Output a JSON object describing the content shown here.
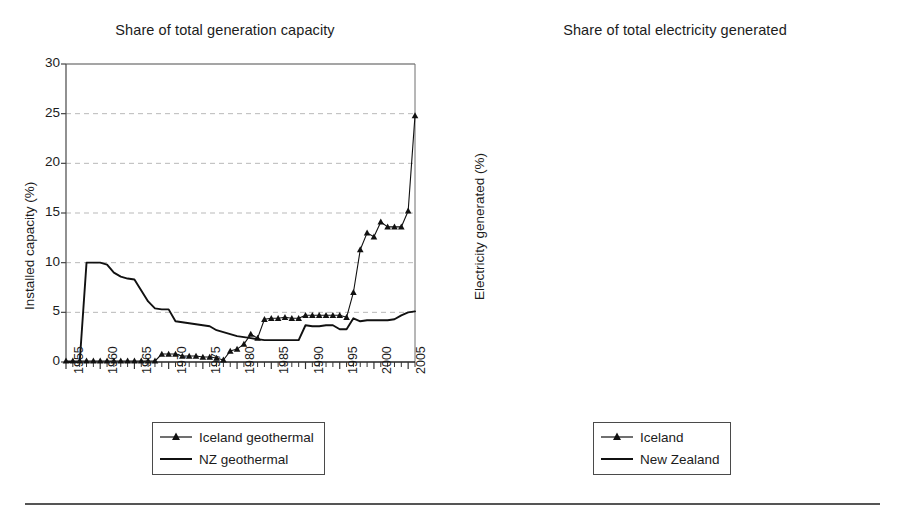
{
  "figure": {
    "background": "#ffffff",
    "rule_color": "#555555",
    "axis_color": "#6e6e6e",
    "grid_color": "#b9b9b9",
    "series_color": "#111111"
  },
  "chart_data": [
    {
      "type": "line",
      "panel": "left",
      "title": "Share of total generation capacity",
      "xlabel": "",
      "ylabel": "Installed capacity (%)",
      "ylim": [
        0,
        30
      ],
      "yticks": [
        0,
        5,
        10,
        15,
        20,
        25,
        30
      ],
      "xlim": [
        1955,
        2006
      ],
      "xticks": [
        1955,
        1960,
        1965,
        1970,
        1975,
        1980,
        1985,
        1990,
        1995,
        2000,
        2005
      ],
      "grid": "horizontal-dashed",
      "legend_position": "below-center",
      "x": [
        1955,
        1956,
        1957,
        1958,
        1959,
        1960,
        1961,
        1962,
        1963,
        1964,
        1965,
        1966,
        1967,
        1968,
        1969,
        1970,
        1971,
        1972,
        1973,
        1974,
        1975,
        1976,
        1977,
        1978,
        1979,
        1980,
        1981,
        1982,
        1983,
        1984,
        1985,
        1986,
        1987,
        1988,
        1989,
        1990,
        1991,
        1992,
        1993,
        1994,
        1995,
        1996,
        1997,
        1998,
        1999,
        2000,
        2001,
        2002,
        2003,
        2004,
        2005,
        2006
      ],
      "series": [
        {
          "name": "Iceland geothermal",
          "marker": "triangle",
          "values": [
            0.1,
            0.1,
            0.1,
            0.1,
            0.1,
            0.1,
            0.1,
            0.1,
            0.1,
            0.1,
            0.1,
            0.1,
            0.1,
            0.1,
            0.8,
            0.8,
            0.8,
            0.6,
            0.6,
            0.6,
            0.5,
            0.5,
            0.4,
            0.2,
            1.1,
            1.3,
            1.8,
            2.8,
            2.4,
            4.3,
            4.4,
            4.4,
            4.5,
            4.4,
            4.4,
            4.7,
            4.7,
            4.7,
            4.7,
            4.7,
            4.7,
            4.5,
            7.0,
            11.3,
            13.0,
            12.6,
            14.1,
            13.6,
            13.6,
            13.6,
            15.2,
            24.8
          ]
        },
        {
          "name": "NZ geothermal",
          "marker": "none",
          "values": [
            0.0,
            0.0,
            0.0,
            10.0,
            10.0,
            10.0,
            9.8,
            9.0,
            8.6,
            8.4,
            8.3,
            7.2,
            6.1,
            5.4,
            5.3,
            5.3,
            4.1,
            4.0,
            3.9,
            3.8,
            3.7,
            3.6,
            3.2,
            3.0,
            2.8,
            2.6,
            2.5,
            2.4,
            2.3,
            2.2,
            2.2,
            2.2,
            2.2,
            2.2,
            2.2,
            3.7,
            3.6,
            3.6,
            3.7,
            3.7,
            3.3,
            3.3,
            4.4,
            4.1,
            4.2,
            4.2,
            4.2,
            4.2,
            4.3,
            4.7,
            5.0,
            5.1
          ]
        }
      ]
    },
    {
      "type": "line",
      "panel": "right",
      "title": "Share of total electricity generated",
      "xlabel": "",
      "ylabel": "Electricity generated (%)",
      "ylim": [
        0,
        30
      ],
      "yticks": [
        0,
        5,
        10,
        15,
        20,
        25,
        30
      ],
      "xlim": [
        1955,
        2006
      ],
      "xticks": [
        1955,
        1960,
        1965,
        1970,
        1975,
        1980,
        1985,
        1990,
        1995,
        2000,
        2005
      ],
      "grid": "horizontal-dashed",
      "legend_position": "below-center",
      "x": [
        1955,
        1956,
        1957,
        1958,
        1959,
        1960,
        1961,
        1962,
        1963,
        1964,
        1965,
        1966,
        1967,
        1968,
        1969,
        1970,
        1971,
        1972,
        1973,
        1974,
        1975,
        1976,
        1977,
        1978,
        1979,
        1980,
        1981,
        1982,
        1983,
        1984,
        1985,
        1986,
        1987,
        1988,
        1989,
        1990,
        1991,
        1992,
        1993,
        1994,
        1995,
        1996,
        1997,
        1998,
        1999,
        2000,
        2001,
        2002,
        2003,
        2004,
        2005,
        2006
      ],
      "series": [
        {
          "name": "Iceland",
          "marker": "triangle",
          "values": [
            0.1,
            0.1,
            0.1,
            0.1,
            0.1,
            0.1,
            0.1,
            0.1,
            0.1,
            0.1,
            0.1,
            0.1,
            0.1,
            0.1,
            0.2,
            0.7,
            0.9,
            1.1,
            1.0,
            0.2,
            0.7,
            0.6,
            0.6,
            0.5,
            1.4,
            1.1,
            3.6,
            4.4,
            4.4,
            4.2,
            4.3,
            5.0,
            5.4,
            5.4,
            4.9,
            6.2,
            6.4,
            4.8,
            5.1,
            5.1,
            5.4,
            6.6,
            6.6,
            10.2,
            15.6,
            17.1,
            18.0,
            16.8,
            16.3,
            17.0,
            19.0,
            26.4
          ]
        },
        {
          "name": "New Zealand",
          "marker": "none",
          "values": [
            0.0,
            0.0,
            0.0,
            0.0,
            0.1,
            2.0,
            5.6,
            7.8,
            9.7,
            11.2,
            12.3,
            12.0,
            11.8,
            9.0,
            9.9,
            9.3,
            8.5,
            7.6,
            6.5,
            6.7,
            6.2,
            5.9,
            5.7,
            5.4,
            5.0,
            5.1,
            4.4,
            4.4,
            4.5,
            4.4,
            4.3,
            4.3,
            4.2,
            4.3,
            5.4,
            6.3,
            6.4,
            6.3,
            6.6,
            6.2,
            6.2,
            6.5,
            6.9,
            7.2,
            7.2,
            7.0,
            6.9,
            6.6,
            6.1,
            6.6,
            7.4,
            7.5
          ]
        }
      ]
    }
  ],
  "left_panel": {
    "title": "Share of total generation capacity",
    "ylabel": "Installed capacity (%)",
    "ytick_labels": [
      "30",
      "25",
      "20",
      "15",
      "10",
      "5",
      "0"
    ],
    "xtick_labels": [
      "1955",
      "1960",
      "1965",
      "1970",
      "1975",
      "1980",
      "1985",
      "1990",
      "1995",
      "2000",
      "2005"
    ],
    "legend": [
      {
        "label": "Iceland geothermal",
        "key": "line-with-triangle-marker"
      },
      {
        "label": "NZ geothermal",
        "key": "plain-line"
      }
    ]
  },
  "right_panel": {
    "title": "Share of total electricity generated",
    "ylabel": "Electricity generated (%)",
    "ytick_labels": [
      "30",
      "25",
      "20",
      "15",
      "10",
      "5",
      "0"
    ],
    "xtick_labels": [
      "1955",
      "1960",
      "1965",
      "1970",
      "1975",
      "1980",
      "1985",
      "1990",
      "1995",
      "2000",
      "2005"
    ],
    "legend": [
      {
        "label": "Iceland",
        "key": "line-with-triangle-marker"
      },
      {
        "label": "New Zealand",
        "key": "plain-line"
      }
    ]
  }
}
